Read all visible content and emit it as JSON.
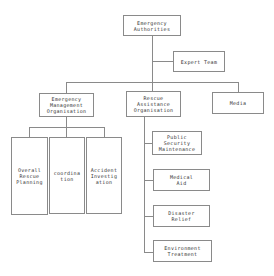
{
  "diagram": {
    "root": {
      "label": "Emergency\nAuthorities"
    },
    "expert": {
      "label": "Expert Team"
    },
    "level2": [
      {
        "label": "Emergency\nManagement\nOrganisation"
      },
      {
        "label": "Rescue\nAssistance\nOrganisation"
      },
      {
        "label": "Media"
      }
    ],
    "management_children": [
      {
        "label": "Overall\nRescue\nPlanning"
      },
      {
        "label": "coordina\ntion"
      },
      {
        "label": "Accident\nInvestig\nation"
      }
    ],
    "rescue_children": [
      {
        "label": "Public\nSecurity\nMaintenance"
      },
      {
        "label": "Medical\nAid"
      },
      {
        "label": "Disaster\nRelief"
      },
      {
        "label": "Environment\nTreatment"
      }
    ]
  }
}
